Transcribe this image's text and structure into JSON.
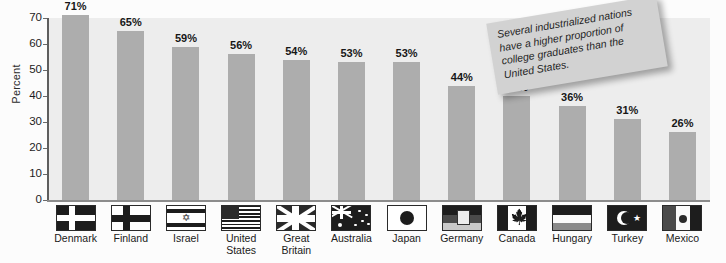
{
  "chart_data": {
    "type": "bar",
    "title": "",
    "xlabel": "",
    "ylabel": "Percent",
    "ylim": [
      0,
      70
    ],
    "yticks": [
      0,
      10,
      20,
      30,
      40,
      50,
      60,
      70
    ],
    "grid": false,
    "legend": "none",
    "categories": [
      "Denmark",
      "Finland",
      "Israel",
      "United States",
      "Great Britain",
      "Australia",
      "Japan",
      "Germany",
      "Canada",
      "Hungary",
      "Turkey",
      "Mexico"
    ],
    "values": [
      71,
      65,
      59,
      56,
      54,
      53,
      53,
      44,
      40,
      36,
      31,
      26
    ],
    "value_labels": [
      "71%",
      "65%",
      "59%",
      "56%",
      "54%",
      "53%",
      "53%",
      "44%",
      "40%",
      "36%",
      "31%",
      "26%"
    ],
    "bar_color": "#adadad",
    "plot_background": "#ededed"
  },
  "annotation": {
    "note_text": "Several industrialized nations have a higher proportion of college graduates than the United States.",
    "note_color": "#d2d2d2"
  },
  "axis": {
    "y_title": "Percent",
    "ticks": [
      "70",
      "60",
      "50",
      "40",
      "30",
      "20",
      "10",
      "0"
    ]
  },
  "categories": [
    {
      "label": "Denmark",
      "value_label": "71%",
      "flag": "flag-denmark"
    },
    {
      "label": "Finland",
      "value_label": "65%",
      "flag": "flag-finland"
    },
    {
      "label": "Israel",
      "value_label": "59%",
      "flag": "flag-israel"
    },
    {
      "label": "United States",
      "value_label": "56%",
      "flag": "flag-united-states"
    },
    {
      "label": "Great Britain",
      "value_label": "54%",
      "flag": "flag-great-britain"
    },
    {
      "label": "Australia",
      "value_label": "53%",
      "flag": "flag-australia"
    },
    {
      "label": "Japan",
      "value_label": "53%",
      "flag": "flag-japan"
    },
    {
      "label": "Germany",
      "value_label": "44%",
      "flag": "flag-germany"
    },
    {
      "label": "Canada",
      "value_label": "40%",
      "flag": "flag-canada"
    },
    {
      "label": "Hungary",
      "value_label": "36%",
      "flag": "flag-hungary"
    },
    {
      "label": "Turkey",
      "value_label": "31%",
      "flag": "flag-turkey"
    },
    {
      "label": "Mexico",
      "value_label": "26%",
      "flag": "flag-mexico"
    }
  ]
}
